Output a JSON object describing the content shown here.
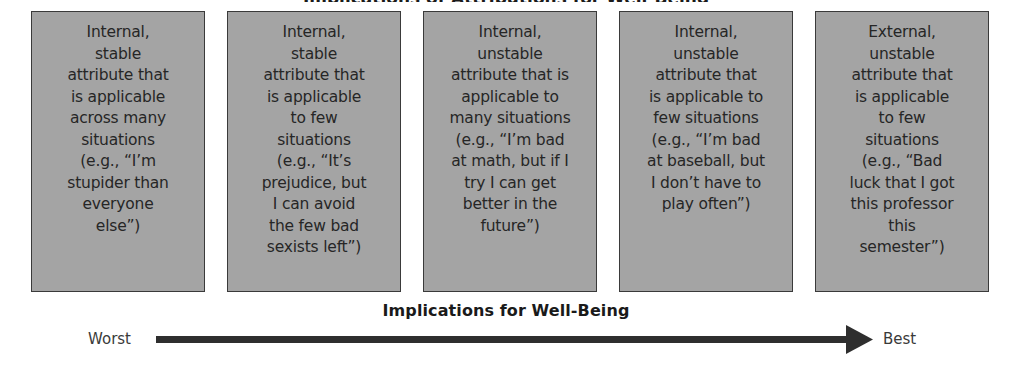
{
  "figure": {
    "top_title_partial": "Implications of Attributions for Well-Being",
    "boxes": [
      {
        "text": "Internal,\nstable\nattribute that\nis applicable\nacross many\nsituations\n(e.g., “I’m\nstupider than\neveryone\nelse”)"
      },
      {
        "text": "Internal,\nstable\nattribute that\nis applicable\nto few\nsituations\n(e.g., “It’s\nprejudice, but\nI can avoid\nthe few bad\nsexists left”)"
      },
      {
        "text": "Internal,\nunstable\nattribute that is\napplicable to\nmany situations\n(e.g., “I’m bad\nat math, but if I\ntry I can get\nbetter in the\nfuture”)"
      },
      {
        "text": "Internal,\nunstable\nattribute that\nis applicable to\nfew situations\n(e.g., “I’m bad\nat baseball, but\nI don’t have to\nplay often”)"
      },
      {
        "text": "External,\nunstable\nattribute that\nis applicable\nto few\nsituations\n(e.g., “Bad\nluck that I got\nthis professor\nthis\nsemester”)"
      }
    ],
    "axis": {
      "title": "Implications for Well-Being",
      "left_label": "Worst",
      "right_label": "Best"
    },
    "colors": {
      "box_fill": "#a4a4a4",
      "box_border": "#3a3a3a",
      "arrow": "#2e2e2e",
      "text": "#262626"
    }
  }
}
